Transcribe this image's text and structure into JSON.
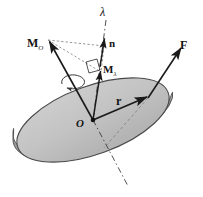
{
  "figure": {
    "background_color": "#ffffff",
    "disk_fill_color": "#c4c4c4",
    "disk_edge_color": "#4a4a4a",
    "disk_side_color": "#a8a8a8",
    "vector_color": "#1a1a1a",
    "labels": {
      "moment_about_point": {
        "text": "M",
        "subscript": "O",
        "name": "moment-about-point-O"
      },
      "axis": {
        "text": "λ",
        "name": "axis-lambda"
      },
      "unit_normal": {
        "text": "n",
        "name": "unit-vector-n"
      },
      "moment_about_axis": {
        "text": "M",
        "subscript": "λ",
        "name": "moment-about-axis-lambda"
      },
      "force": {
        "text": "F",
        "name": "force-vector-F"
      },
      "position": {
        "text": "r",
        "name": "position-vector-r"
      },
      "origin": {
        "text": "O",
        "name": "origin-point-O"
      }
    },
    "geometry": {
      "origin_point": [
        93,
        120
      ],
      "disk_center": [
        93,
        120
      ],
      "disk_rx": 80,
      "disk_ry": 34,
      "disk_rotation_deg": -20,
      "vector_Mo_tip": [
        48,
        40
      ],
      "vector_n_tip": [
        104,
        40
      ],
      "vector_Mlambda_tip": [
        100,
        72
      ],
      "vector_F_tip": [
        180,
        47
      ],
      "vector_r_tip": [
        145,
        98
      ],
      "axis_lambda_top": [
        106,
        20
      ],
      "axis_lambda_bottom": [
        127,
        185
      ]
    }
  }
}
